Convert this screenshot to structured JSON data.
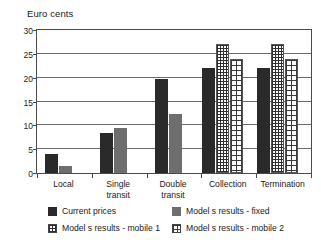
{
  "chart_data": {
    "type": "bar",
    "title": "Euro cents",
    "xlabel": "",
    "ylabel": "Euro cents",
    "ylim": [
      0,
      30
    ],
    "yticks": [
      0,
      5,
      10,
      15,
      20,
      25,
      30
    ],
    "ytick_labels": [
      "0",
      "5",
      "10",
      "15",
      "20",
      "25",
      "30"
    ],
    "grid": true,
    "legend_position": "bottom",
    "categories": [
      "Local",
      "Single transit",
      "Double transit",
      "Collection",
      "Termination"
    ],
    "category_lines": [
      [
        "Local"
      ],
      [
        "Single",
        "transit"
      ],
      [
        "Double",
        "transit"
      ],
      [
        "Collection"
      ],
      [
        "Termination"
      ]
    ],
    "series": [
      {
        "name": "Current prices",
        "key": "current",
        "fill": "solid-dark",
        "color": "#2a2a2a",
        "values": [
          4.0,
          8.3,
          19.8,
          22.0,
          22.0
        ]
      },
      {
        "name": "Model s results - fixed",
        "key": "fixed",
        "fill": "solid-gray",
        "color": "#6e6e6e",
        "values": [
          1.5,
          9.5,
          12.3,
          null,
          null
        ]
      },
      {
        "name": "Model s results - mobile 1",
        "key": "mobile1",
        "fill": "dotted-grid",
        "color": "#2f2f2f",
        "values": [
          null,
          null,
          null,
          27.0,
          27.0
        ]
      },
      {
        "name": "Model s results - mobile 2",
        "key": "mobile2",
        "fill": "cross-grid",
        "color": "#3a3a3a",
        "values": [
          null,
          null,
          null,
          24.0,
          24.0
        ]
      }
    ]
  },
  "legend": {
    "items": [
      {
        "label": "Current prices",
        "swatch": "current"
      },
      {
        "label": "Model s results - fixed",
        "swatch": "fixed"
      },
      {
        "label": "Model s results - mobile 1",
        "swatch": "mobile1"
      },
      {
        "label": "Model s results - mobile 2",
        "swatch": "mobile2"
      }
    ]
  },
  "colors": {
    "current_prices": "#2a2a2a",
    "model_fixed": "#6e6e6e",
    "model_mobile1": "#2f2f2f",
    "model_mobile2": "#3a3a3a",
    "grid": "#6b6b6b",
    "frame": "#4a4a4a",
    "text": "#1a1a1a",
    "background": "#ffffff"
  }
}
